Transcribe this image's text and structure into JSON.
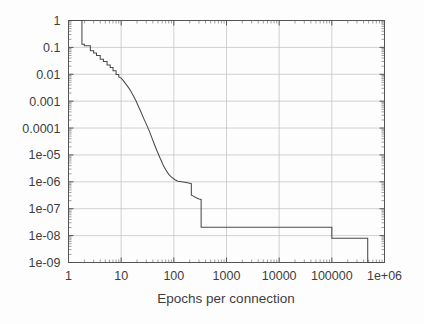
{
  "figure": {
    "background_color": "#fdfdfd",
    "frame_color": "#555555",
    "grid_color": "#bfbfbf",
    "curve_color": "#4a4a4a"
  },
  "chart_data": {
    "type": "line",
    "title": "",
    "subtitle": "",
    "xlabel": "Epochs per connection",
    "ylabel": "",
    "xscale": "log",
    "yscale": "log",
    "xlim": [
      1,
      1000000
    ],
    "ylim": [
      1e-09,
      1
    ],
    "grid": true,
    "legend": null,
    "legend_position": "none",
    "xtick_labels": [
      "1",
      "10",
      "100",
      "1000",
      "10000",
      "100000",
      "1e+06"
    ],
    "xtick_values": [
      1,
      10,
      100,
      1000,
      10000,
      100000,
      1000000
    ],
    "ytick_labels": [
      "1",
      "0.1",
      "0.01",
      "0.001",
      "0.0001",
      "1e-05",
      "1e-06",
      "1e-07",
      "1e-08",
      "1e-09"
    ],
    "ytick_values": [
      1,
      0.1,
      0.01,
      0.001,
      0.0001,
      1e-05,
      1e-06,
      1e-07,
      1e-08,
      1e-09
    ],
    "series": [
      {
        "name": "error curve",
        "style": "step-then-smooth decreasing curve",
        "x": [
          1.0,
          1.8,
          1.8,
          2.0,
          2.0,
          2.6,
          2.6,
          3.0,
          3.0,
          3.4,
          3.4,
          4.0,
          4.0,
          4.6,
          4.6,
          5.4,
          5.4,
          6.2,
          6.2,
          7.0,
          7.0,
          8.0,
          8.0,
          9.0,
          9.0,
          10.0,
          11.0,
          12.0,
          13.5,
          15.0,
          17.0,
          19.0,
          21.0,
          24.0,
          27.0,
          30.0,
          34.0,
          38.0,
          43.0,
          48.0,
          55.0,
          62.0,
          70.0,
          80.0,
          90.0,
          105.0,
          120.0,
          140.0,
          160.0,
          180.0,
          200.0,
          215.0,
          215.0,
          230.0,
          260.0,
          300.0,
          330.0,
          330.0,
          360.0,
          100000.0,
          100000.0,
          480000.0,
          480000.0,
          530000.0,
          1000000.0
        ],
        "y": [
          1.0,
          1.0,
          0.13,
          0.13,
          0.115,
          0.115,
          0.075,
          0.075,
          0.062,
          0.062,
          0.05,
          0.05,
          0.036,
          0.036,
          0.03,
          0.03,
          0.022,
          0.022,
          0.018,
          0.018,
          0.0135,
          0.0135,
          0.0098,
          0.0098,
          0.008,
          0.0072,
          0.0058,
          0.0046,
          0.0034,
          0.0025,
          0.0016,
          0.00105,
          0.00068,
          0.00038,
          0.00022,
          0.00014,
          8e-05,
          4.5e-05,
          2.4e-05,
          1.4e-05,
          7.5e-06,
          4.4e-06,
          2.8e-06,
          1.9e-06,
          1.5e-06,
          1.2e-06,
          1.05e-06,
          1e-06,
          9.6e-07,
          9.2e-07,
          8.8e-07,
          8.5e-07,
          3.2e-07,
          3e-07,
          2.6e-07,
          2.3e-07,
          2.2e-07,
          2.05e-08,
          2.05e-08,
          2.05e-08,
          8e-09,
          8e-09,
          1e-09,
          1e-09,
          1e-09
        ]
      }
    ]
  },
  "axes": {
    "x_title": "Epochs per connection"
  }
}
